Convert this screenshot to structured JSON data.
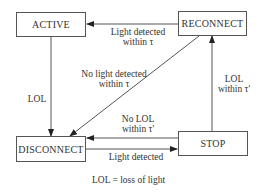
{
  "diagram": {
    "type": "state-machine",
    "states": [
      {
        "id": "active",
        "label": "ACTIVE"
      },
      {
        "id": "reconnect",
        "label": "RECONNECT"
      },
      {
        "id": "disconnect",
        "label": "DISCONNECT"
      },
      {
        "id": "stop",
        "label": "STOP"
      }
    ],
    "transitions": [
      {
        "from": "reconnect",
        "to": "active",
        "label_line1": "Light detected",
        "label_line2": "within τ"
      },
      {
        "from": "active",
        "to": "disconnect",
        "label_line1": "LOL"
      },
      {
        "from": "reconnect",
        "to": "disconnect",
        "label_line1": "No light detected",
        "label_line2": "within τ"
      },
      {
        "from": "stop",
        "to": "reconnect",
        "label_line1": "LOL",
        "label_line2": "within τ'"
      },
      {
        "from": "stop",
        "to": "disconnect",
        "label_line1": "No LOL",
        "label_line2": "within τ'"
      },
      {
        "from": "disconnect",
        "to": "stop",
        "label_line1": "Light detected"
      }
    ],
    "legend": "LOL = loss of light"
  }
}
